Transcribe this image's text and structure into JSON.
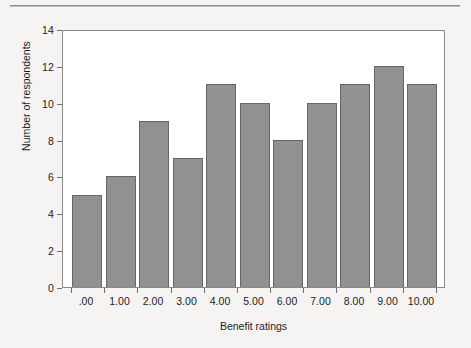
{
  "chart_data": {
    "type": "bar",
    "title": "",
    "subtitle": "",
    "xlabel": "Benefit ratings",
    "ylabel": "Number of respondents",
    "categories": [
      ".00",
      "1.00",
      "2.00",
      "3.00",
      "4.00",
      "5.00",
      "6.00",
      "7.00",
      "8.00",
      "9.00",
      "10.00"
    ],
    "values": [
      5,
      6,
      9,
      7,
      11,
      10,
      8,
      10,
      11,
      12,
      11
    ],
    "ylim": [
      0,
      14
    ],
    "ytick_labels": [
      "0",
      "2",
      "4",
      "6",
      "8",
      "10",
      "12",
      "14"
    ],
    "ytick_values": [
      0,
      2,
      4,
      6,
      8,
      10,
      12,
      14
    ],
    "grid": false,
    "legend_position": "none",
    "bar_fill_color": "#919191",
    "bar_border_color": "#666666",
    "plot_background_color": "#ffffff",
    "figure_background_color": "#f5f4f2",
    "axis_color": "#8a8a8a",
    "text_color": "#1d1d1d"
  }
}
